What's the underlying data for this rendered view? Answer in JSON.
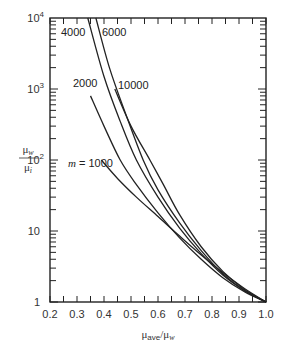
{
  "chart_data": {
    "type": "line",
    "title": "",
    "xlabel": "μave/μw",
    "xlabel_main": "μ",
    "xlabel_sub1": "ave",
    "xlabel_mid": "/μ",
    "xlabel_sub2": "w",
    "ylabel_num": "μw",
    "ylabel_den": "μi",
    "xlim": [
      0.2,
      1.0
    ],
    "ylim": [
      1,
      10000
    ],
    "yscale": "log",
    "x_ticks": [
      "0.2",
      "0.3",
      "0.4",
      "0.5",
      "0.6",
      "0.7",
      "0.8",
      "0.9",
      "1.0"
    ],
    "y_ticks": [
      {
        "value": 1,
        "base": "1",
        "exp": ""
      },
      {
        "value": 10,
        "base": "10",
        "exp": ""
      },
      {
        "value": 100,
        "base": "10",
        "exp": "2"
      },
      {
        "value": 1000,
        "base": "10",
        "exp": "3"
      },
      {
        "value": 10000,
        "base": "10",
        "exp": "4"
      }
    ],
    "grid": false,
    "series": [
      {
        "name": "m = 1000",
        "label": "m = 1000",
        "label_italic_prefix": "m",
        "label_rest": " = 1000",
        "x": [
          0.39,
          0.45,
          0.52,
          0.6,
          0.68,
          0.76,
          0.84,
          0.92,
          1.0
        ],
        "y": [
          100,
          55,
          30,
          16,
          8.5,
          4.6,
          2.6,
          1.55,
          1
        ]
      },
      {
        "name": "m = 2000",
        "label": "2000",
        "x": [
          0.35,
          0.4,
          0.46,
          0.52,
          0.6,
          0.68,
          0.76,
          0.84,
          0.92,
          1.0
        ],
        "y": [
          800,
          300,
          100,
          45,
          18,
          8,
          4,
          2.2,
          1.4,
          1
        ]
      },
      {
        "name": "m = 4000",
        "label": "4000",
        "x": [
          0.34,
          0.4,
          0.46,
          0.52,
          0.6,
          0.68,
          0.76,
          0.84,
          0.92,
          1.0
        ],
        "y": [
          10000,
          1500,
          350,
          100,
          30,
          11,
          4.8,
          2.4,
          1.45,
          1
        ]
      },
      {
        "name": "m = 6000",
        "label": "6000",
        "x": [
          0.37,
          0.42,
          0.48,
          0.545,
          0.6,
          0.68,
          0.76,
          0.84,
          0.92,
          1.0
        ],
        "y": [
          10000,
          2000,
          450,
          100,
          38,
          13,
          5.3,
          2.5,
          1.45,
          1
        ]
      },
      {
        "name": "m = 10000",
        "label": "10000",
        "x": [
          0.44,
          0.5,
          0.57,
          0.62,
          0.68,
          0.76,
          0.84,
          0.92,
          1.0
        ],
        "y": [
          1000,
          300,
          100,
          45,
          17,
          6,
          2.7,
          1.5,
          1
        ]
      }
    ]
  }
}
